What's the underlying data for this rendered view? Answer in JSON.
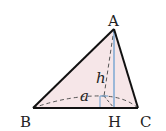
{
  "diagram": {
    "type": "geometry-triangle-pyramid",
    "labels": {
      "A": "A",
      "B": "B",
      "C": "C",
      "H": "H",
      "h": "h",
      "a": "a"
    },
    "colors": {
      "fill": "#f6e6e8",
      "edge": "#111111",
      "altitude": "#6a9fd0",
      "dashed": "#555555"
    },
    "points": {
      "A": [
        114,
        29
      ],
      "B": [
        33,
        108
      ],
      "C": [
        138,
        108
      ],
      "H": [
        114,
        108
      ],
      "P": [
        104,
        96
      ]
    }
  }
}
